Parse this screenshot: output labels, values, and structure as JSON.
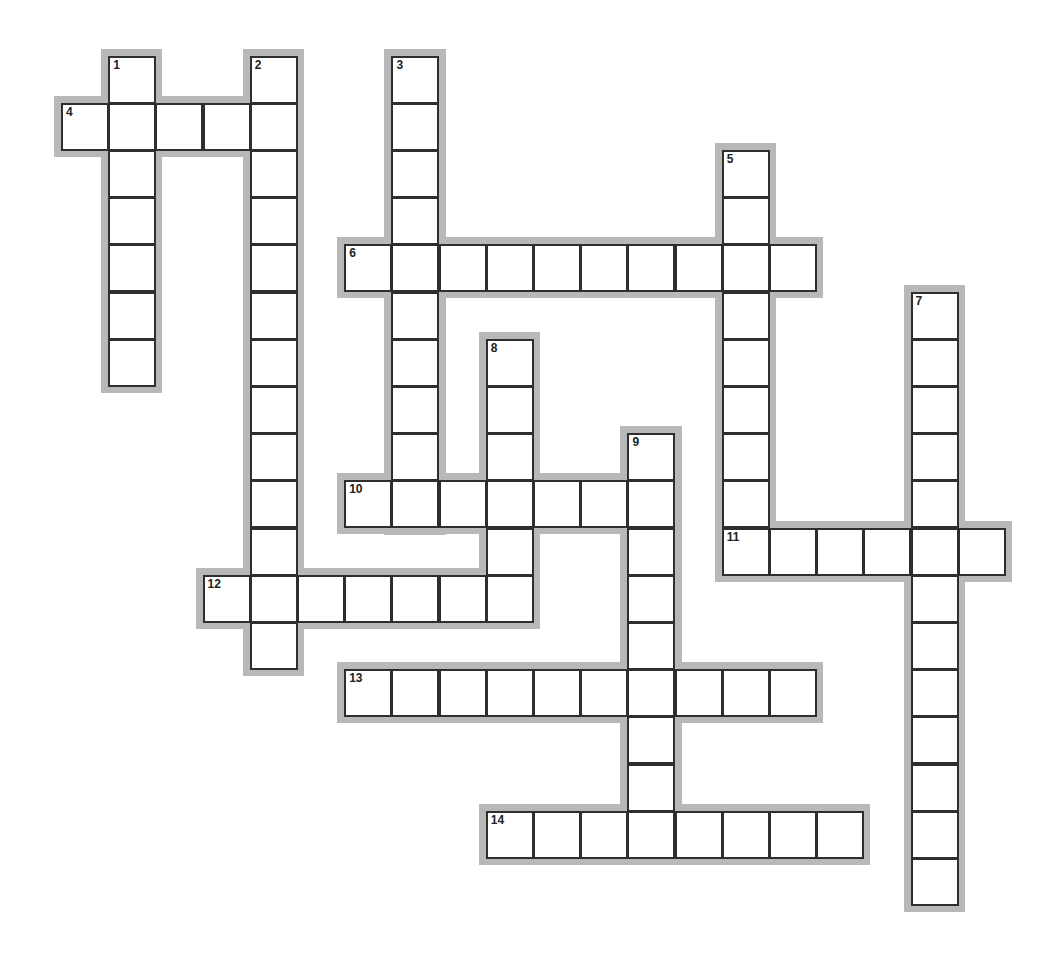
{
  "puzzle": {
    "type": "crossword",
    "grid": {
      "origin_x": 61,
      "origin_y": 55.5,
      "pitch": 47.2,
      "cell_size": 48
    },
    "colors": {
      "background": "#ffffff",
      "halo": "#b8b8b8",
      "cell_border": "#2e2e2e",
      "cell_fill": "#ffffff",
      "number": "#222222"
    },
    "words": [
      {
        "number": "1",
        "direction": "down",
        "row": 0,
        "col": 1,
        "length": 7
      },
      {
        "number": "2",
        "direction": "down",
        "row": 0,
        "col": 4,
        "length": 13
      },
      {
        "number": "3",
        "direction": "down",
        "row": 0,
        "col": 7,
        "length": 10
      },
      {
        "number": "4",
        "direction": "across",
        "row": 1,
        "col": 0,
        "length": 5
      },
      {
        "number": "5",
        "direction": "down",
        "row": 2,
        "col": 14,
        "length": 9
      },
      {
        "number": "6",
        "direction": "across",
        "row": 4,
        "col": 6,
        "length": 10
      },
      {
        "number": "7",
        "direction": "down",
        "row": 5,
        "col": 18,
        "length": 13
      },
      {
        "number": "8",
        "direction": "down",
        "row": 6,
        "col": 9,
        "length": 6
      },
      {
        "number": "9",
        "direction": "down",
        "row": 8,
        "col": 12,
        "length": 9
      },
      {
        "number": "10",
        "direction": "across",
        "row": 9,
        "col": 6,
        "length": 7
      },
      {
        "number": "11",
        "direction": "across",
        "row": 10,
        "col": 14,
        "length": 6
      },
      {
        "number": "12",
        "direction": "across",
        "row": 11,
        "col": 3,
        "length": 7
      },
      {
        "number": "13",
        "direction": "across",
        "row": 13,
        "col": 6,
        "length": 10
      },
      {
        "number": "14",
        "direction": "across",
        "row": 16,
        "col": 9,
        "length": 8
      }
    ]
  }
}
